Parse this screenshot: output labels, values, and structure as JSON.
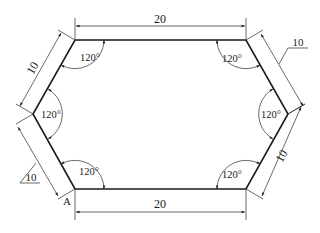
{
  "figure": {
    "shape": "hexagon",
    "vertex_label": "A",
    "dimensions": {
      "top_length": "20",
      "bottom_length": "20",
      "upper_left_side": "10",
      "lower_right_side": "10",
      "upper_right_leader": "10",
      "lower_left_leader": "10"
    },
    "angles": {
      "top_left": "120°",
      "top_right": "120°",
      "left": "120°",
      "right": "120°",
      "bottom_left": "120°",
      "bottom_right": "120°"
    }
  }
}
